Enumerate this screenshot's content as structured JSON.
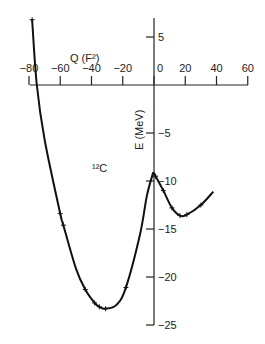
{
  "chart_data": {
    "type": "line",
    "title": "",
    "xlabel": "Q (F²)",
    "ylabel": "E (MeV)",
    "annotation": "¹²C",
    "xlim": [
      -80,
      60
    ],
    "ylim": [
      -25,
      7
    ],
    "xticks": [
      -80,
      -60,
      -40,
      -20,
      0,
      20,
      40,
      60
    ],
    "xtick_labels": [
      "−80",
      "−60",
      "−40",
      "−20",
      "0",
      "20",
      "40",
      "60"
    ],
    "yticks": [
      5,
      -5,
      -10,
      -15,
      -20,
      -25
    ],
    "ytick_labels": [
      "5",
      "−5",
      "−10",
      "−15",
      "−20",
      "−25"
    ],
    "grid": false,
    "legend": null,
    "series": [
      {
        "name": "oblate branch",
        "x": [
          -78,
          -75,
          -70,
          -60,
          -58,
          -50,
          -44,
          -38,
          -35,
          -31,
          -24,
          -18,
          -9,
          -4.5,
          -0.5
        ],
        "y": [
          6.8,
          0,
          -5.7,
          -13.4,
          -14.6,
          -19.1,
          -21.3,
          -22.7,
          -23.1,
          -23.3,
          -22.9,
          -21.1,
          -15.6,
          -11.5,
          -9.1
        ]
      },
      {
        "name": "prolate branch",
        "x": [
          -0.5,
          1,
          6,
          11.5,
          16.6,
          21,
          30,
          38
        ],
        "y": [
          -9.1,
          -9.5,
          -11,
          -12.8,
          -13.6,
          -13.5,
          -12.5,
          -11.1
        ]
      }
    ],
    "markers": {
      "x": [
        -78,
        -60,
        -58,
        -44,
        -38,
        -35,
        -31,
        -18,
        1,
        6,
        11.5,
        16.6,
        21,
        30
      ],
      "y": [
        6.8,
        -13.4,
        -14.6,
        -21.3,
        -22.7,
        -23.1,
        -23.3,
        -21.1,
        -9.5,
        -11,
        -12.8,
        -13.6,
        -13.5,
        -12.5
      ]
    }
  }
}
